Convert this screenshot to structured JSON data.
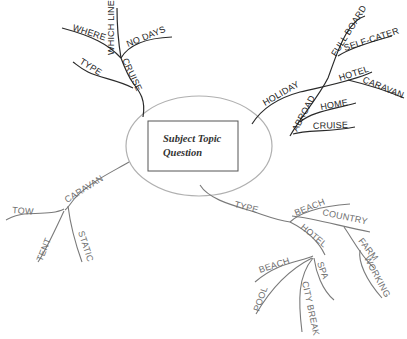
{
  "center": {
    "line1": "Subject Topic",
    "line2": "Question"
  },
  "colors": {
    "dark_branch": "#2a2a2a",
    "light_branch": "#7a7a7a",
    "ellipse": "#b0b0b0",
    "box": "#555555"
  },
  "branches": {
    "cruise": {
      "label": "CRUISE",
      "children": [
        "WHERE",
        "WHICH LINE",
        "NO DAYS",
        "TYPE"
      ]
    },
    "holiday": {
      "label": "HOLIDAY",
      "children": [
        "HOTEL",
        "CARAVAN"
      ]
    },
    "abroad": {
      "label": "ABROAD",
      "children": [
        "FULL BOARD",
        "SELF-CATER",
        "HOME",
        "CRUISE"
      ]
    },
    "caravan": {
      "label": "CARAVAN",
      "children": [
        "TOW",
        "TENT",
        "STATIC"
      ]
    },
    "type": {
      "label": "TYPE",
      "children": [
        "BEACH",
        "COUNTRY",
        "HOTEL"
      ],
      "country_children": [
        "FARM",
        "WORKING"
      ],
      "hotel_children": [
        "BEACH",
        "POOL",
        "CITY BREAK",
        "SPA"
      ]
    }
  }
}
